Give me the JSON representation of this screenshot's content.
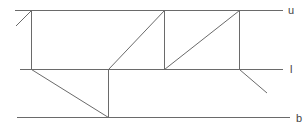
{
  "diagram": {
    "type": "level-path",
    "stroke_color": "#6a6a6a",
    "levels": [
      {
        "id": "upper",
        "label": "u",
        "y": 10,
        "x1": 15,
        "x2": 283
      },
      {
        "id": "lower",
        "label": "l",
        "y": 69,
        "x1": 20,
        "x2": 283
      },
      {
        "id": "bottom",
        "label": "b",
        "y": 117,
        "x1": 17,
        "x2": 290
      }
    ],
    "path_points": [
      [
        16,
        26
      ],
      [
        31,
        10
      ],
      [
        31,
        69
      ],
      [
        108,
        117
      ],
      [
        108,
        69
      ],
      [
        164,
        10
      ],
      [
        164,
        69
      ],
      [
        239,
        10
      ],
      [
        239,
        69
      ],
      [
        267,
        93
      ]
    ]
  }
}
